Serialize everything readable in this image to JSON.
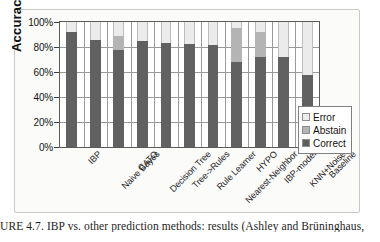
{
  "figure": {
    "caption_prefix": "URE 4.7.",
    "caption_text": "IBP vs. other prediction methods: results (Ashley and Brüninghaus,"
  },
  "legend": {
    "position": "inside-bottom-right",
    "items": [
      {
        "label": "Error",
        "color": "#ececec"
      },
      {
        "label": "Abstain",
        "color": "#b4b4b4"
      },
      {
        "label": "Correct",
        "color": "#5e5e5e"
      }
    ]
  },
  "axis": {
    "y_title": "Accuracy",
    "y_ticks": [
      "100%",
      "80%",
      "60%",
      "40%",
      "20%",
      "0%"
    ]
  },
  "chart_data": {
    "type": "bar",
    "stacked": true,
    "title": "",
    "xlabel": "",
    "ylabel": "Accuracy",
    "ylim": [
      0,
      100
    ],
    "yticks": [
      0,
      20,
      40,
      60,
      80,
      100
    ],
    "ytick_labels": [
      "0%",
      "20%",
      "40%",
      "60%",
      "80%",
      "100%"
    ],
    "grid": true,
    "legend_position": "inside-bottom-right",
    "categories": [
      "IBP",
      "Naive Bayes",
      "CATO",
      "Decision Tree",
      "Tree->Rules",
      "Rule Learner",
      "Nearest-Neighbor",
      "HYPO",
      "IBP-model",
      "KNN+Noise",
      "Baseline"
    ],
    "series": [
      {
        "name": "Correct",
        "color": "#616161",
        "values": [
          92,
          86,
          78,
          85,
          83,
          82.5,
          82,
          68,
          72,
          72,
          58
        ]
      },
      {
        "name": "Abstain",
        "color": "#b4b4b4",
        "values": [
          0,
          0,
          11,
          0,
          0,
          0,
          0,
          27,
          20,
          0,
          0
        ]
      },
      {
        "name": "Error",
        "color": "#ebebeb",
        "values": [
          8,
          14,
          11,
          15,
          17,
          17.5,
          18,
          5,
          8,
          28,
          42
        ]
      }
    ]
  }
}
